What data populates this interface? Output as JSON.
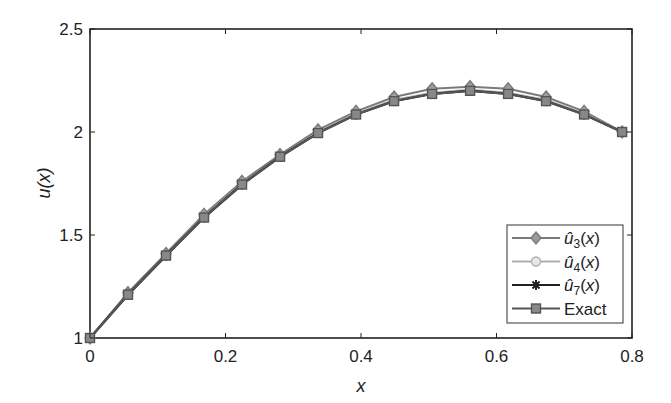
{
  "chart_data": {
    "type": "line",
    "title": "",
    "xlabel": "x",
    "ylabel": "u(x)",
    "xlim": [
      0,
      0.8
    ],
    "ylim": [
      1,
      2.5
    ],
    "xticks": [
      "0",
      "0.2",
      "0.4",
      "0.6",
      "0.8"
    ],
    "yticks": [
      "1",
      "1.5",
      "2",
      "2.5"
    ],
    "grid": false,
    "legend_position": "lower right",
    "x": [
      0,
      0.0561,
      0.1122,
      0.1683,
      0.2244,
      0.2805,
      0.3366,
      0.3927,
      0.4488,
      0.5049,
      0.561,
      0.6171,
      0.6732,
      0.7293,
      0.7854
    ],
    "series": [
      {
        "name": "û3(x)",
        "label_base": "û",
        "label_sub": "3",
        "marker": "diamond",
        "color": "#7a7a7a",
        "values": [
          1.0,
          1.22,
          1.41,
          1.6,
          1.76,
          1.89,
          2.01,
          2.1,
          2.17,
          2.21,
          2.22,
          2.21,
          2.17,
          2.1,
          2.0
        ]
      },
      {
        "name": "û4(x)",
        "label_base": "û",
        "label_sub": "4",
        "marker": "circle",
        "color": "#b0b0b0",
        "values": [
          1.0,
          1.21,
          1.4,
          1.59,
          1.75,
          1.88,
          2.0,
          2.09,
          2.155,
          2.19,
          2.205,
          2.19,
          2.155,
          2.09,
          2.0
        ]
      },
      {
        "name": "û7(x)",
        "label_base": "û",
        "label_sub": "7",
        "marker": "star",
        "color": "#222222",
        "values": [
          1.0,
          1.21,
          1.4,
          1.585,
          1.745,
          1.88,
          1.995,
          2.085,
          2.15,
          2.185,
          2.2,
          2.185,
          2.15,
          2.085,
          2.0
        ]
      },
      {
        "name": "Exact",
        "label_base": "Exact",
        "label_sub": "",
        "marker": "square",
        "color": "#555555",
        "values": [
          1.0,
          1.21,
          1.4,
          1.585,
          1.745,
          1.88,
          1.995,
          2.085,
          2.15,
          2.185,
          2.2,
          2.185,
          2.15,
          2.085,
          2.0
        ]
      }
    ]
  },
  "axes": {
    "xlabel": "x",
    "ylabel": "u(x)"
  },
  "legend": {
    "items": [
      {
        "base": "û",
        "sub": "3",
        "tail": "(x)"
      },
      {
        "base": "û",
        "sub": "4",
        "tail": "(x)"
      },
      {
        "base": "û",
        "sub": "7",
        "tail": "(x)"
      },
      {
        "base": "Exact",
        "sub": "",
        "tail": ""
      }
    ]
  }
}
